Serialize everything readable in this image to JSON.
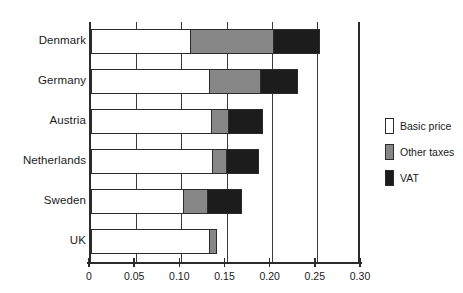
{
  "chart_data": {
    "type": "bar",
    "orientation": "horizontal",
    "stacked": true,
    "title": "",
    "subtitle": "",
    "xlabel": "",
    "ylabel": "",
    "xlim": [
      0,
      0.3
    ],
    "ylim": null,
    "grid": true,
    "grid_axis": "x",
    "legend_position": "right",
    "categories": [
      "Denmark",
      "Germany",
      "Austria",
      "Netherlands",
      "Sweden",
      "UK"
    ],
    "tick_values": [
      0,
      0.05,
      0.1,
      0.15,
      0.2,
      0.25,
      0.3
    ],
    "tick_labels": [
      "0",
      "0.05",
      "0.10",
      "0.15",
      "0.20",
      "0.25",
      "0.30"
    ],
    "series": [
      {
        "name": "Basic price",
        "color": "#ffffff",
        "values": [
          0.111,
          0.132,
          0.134,
          0.135,
          0.103,
          0.132
        ]
      },
      {
        "name": "Other taxes",
        "color": "#878787",
        "values": [
          0.092,
          0.056,
          0.019,
          0.016,
          0.027,
          0.007
        ]
      },
      {
        "name": "VAT",
        "color": "#1c1c1c",
        "values": [
          0.051,
          0.041,
          0.037,
          0.035,
          0.037,
          0.0
        ]
      }
    ],
    "totals": [
      0.254,
      0.229,
      0.19,
      0.186,
      0.167,
      0.139
    ]
  },
  "legend": {
    "items": [
      {
        "label": "Basic price",
        "swatch": "legend-swatch-basic-price"
      },
      {
        "label": "Other taxes",
        "swatch": "legend-swatch-other-taxes"
      },
      {
        "label": "VAT",
        "swatch": "legend-swatch-vat"
      }
    ]
  }
}
